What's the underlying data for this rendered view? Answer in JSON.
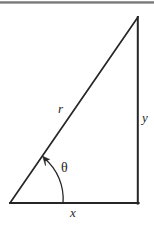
{
  "figure": {
    "kind": "right-triangle-polar-coordinates-diagram",
    "background_color": "#ffffff",
    "stroke_color": "#262626",
    "labels": {
      "hypotenuse": "r",
      "vertical_leg": "y",
      "horizontal_leg": "x",
      "angle": "θ"
    },
    "geometry": {
      "origin_vertex": [
        10,
        203
      ],
      "right_angle_vertex": [
        138,
        203
      ],
      "apex_vertex": [
        138,
        17
      ],
      "angle_arc_start_on_base": [
        63,
        203
      ],
      "angle_arc_end_on_hypotenuse": [
        44,
        158
      ]
    },
    "scan_edge_band": {
      "present": true,
      "color": "#6e6e6e"
    }
  }
}
